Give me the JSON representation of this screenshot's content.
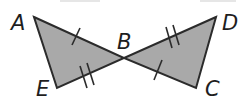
{
  "figure": {
    "type": "congruent-triangles-vertical-angles",
    "fill_color": "#a9a9a9",
    "stroke_color": "#2b2b2b",
    "triangles": [
      {
        "name": "triangle-ABE",
        "vertices": [
          "A",
          "B",
          "E"
        ]
      },
      {
        "name": "triangle-DBC",
        "vertices": [
          "D",
          "B",
          "C"
        ]
      }
    ],
    "labels": {
      "A": "A",
      "B": "B",
      "C": "C",
      "D": "D",
      "E": "E"
    },
    "congruence_marks": [
      {
        "segment": "AB",
        "ticks": 1
      },
      {
        "segment": "BC",
        "ticks": 1
      },
      {
        "segment": "EB",
        "ticks": 2
      },
      {
        "segment": "BD",
        "ticks": 2
      }
    ]
  }
}
